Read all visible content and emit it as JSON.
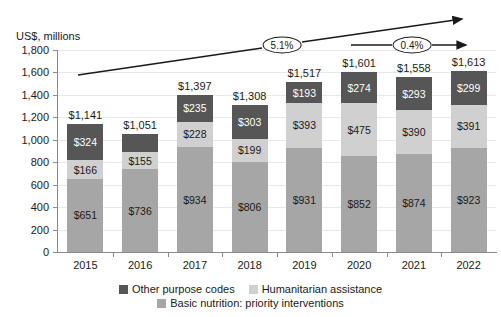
{
  "chart_data": {
    "type": "bar",
    "subtype": "stacked-bar",
    "title": "",
    "xlabel": "",
    "ylabel": "US$, millions",
    "ylim": [
      0,
      1800
    ],
    "ytick_step": 200,
    "ytick_labels": [
      "0",
      "200",
      "400",
      "600",
      "800",
      "1,000",
      "1,200",
      "1,400",
      "1,600",
      "1,800"
    ],
    "ytick_values": [
      0,
      200,
      400,
      600,
      800,
      1000,
      1200,
      1400,
      1600,
      1800
    ],
    "grid": true,
    "legend_position": "bottom",
    "categories": [
      "2015",
      "2016",
      "2017",
      "2018",
      "2019",
      "2020",
      "2021",
      "2022"
    ],
    "series": [
      {
        "name": "Basic nutrition: priority interventions",
        "color": "#a6a6a6",
        "values": [
          651,
          736,
          934,
          806,
          931,
          852,
          874,
          923
        ],
        "labels": [
          "$651",
          "$736",
          "$934",
          "$806",
          "$931",
          "$852",
          "$874",
          "$923"
        ]
      },
      {
        "name": "Humanitarian assistance",
        "color": "#d0d0d0",
        "values": [
          166,
          155,
          228,
          199,
          393,
          475,
          390,
          391
        ],
        "labels": [
          "$166",
          "$155",
          "$228",
          "$199",
          "$393",
          "$475",
          "$390",
          "$391"
        ]
      },
      {
        "name": "Other purpose codes",
        "color": "#565656",
        "values": [
          324,
          160,
          235,
          303,
          193,
          274,
          293,
          299
        ],
        "labels": [
          "$324",
          "",
          "$235",
          "$303",
          "$193",
          "$274",
          "$293",
          "$299"
        ]
      }
    ],
    "totals": [
      1141,
      1051,
      1397,
      1308,
      1517,
      1601,
      1558,
      1613
    ],
    "total_labels": [
      "$1,141",
      "$1,051",
      "$1,397",
      "$1,308",
      "$1,517",
      "$1,601",
      "$1,558",
      "$1,613"
    ],
    "annotations": [
      {
        "name": "growth-trend-2015-2022",
        "label": "5.1%"
      },
      {
        "name": "growth-trend-2020-2022",
        "label": "0.4%"
      }
    ]
  },
  "legend": {
    "items": [
      {
        "label": "Other purpose codes",
        "color": "#565656"
      },
      {
        "label": "Humanitarian assistance",
        "color": "#d0d0d0"
      },
      {
        "label": "Basic nutrition: priority interventions",
        "color": "#a6a6a6"
      }
    ]
  }
}
